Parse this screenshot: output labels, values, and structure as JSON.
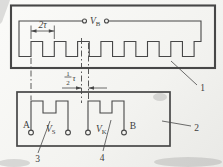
{
  "colors": {
    "ink": "#474747",
    "paper": "#f4f4f1"
  },
  "diagram": {
    "type": "inductosyn-linear-encoder-schematic",
    "labels": {
      "excitation_voltage": {
        "main": "V",
        "sub": "B"
      },
      "sine_voltage": {
        "main": "V",
        "sub": "S"
      },
      "cosine_voltage": {
        "main": "V",
        "sub": "K"
      },
      "terminal_a": "A",
      "terminal_b": "B",
      "part_scale": "1",
      "part_slider": "2",
      "part_sine_winding": "3",
      "part_cosine_winding": "4"
    },
    "dimensions": {
      "pitch": "2τ",
      "half_pitch": {
        "numerator": "1",
        "denominator": "2",
        "symbol": "τ"
      }
    }
  }
}
